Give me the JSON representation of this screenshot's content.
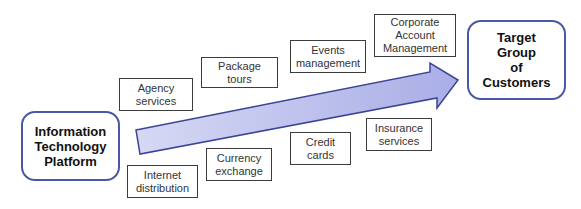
{
  "diagram": {
    "source": {
      "label": "Information\nTechnology\nPlatform"
    },
    "target": {
      "label": "Target\nGroup\nof\nCustomers"
    },
    "arrow": {
      "fill": "#b8bcec",
      "stroke": "#3b4494"
    },
    "services_above": [
      {
        "label": "Agency\nservices"
      },
      {
        "label": "Package\ntours"
      },
      {
        "label": "Events\nmanagement"
      },
      {
        "label": "Corporate\nAccount\nManagement"
      }
    ],
    "services_below": [
      {
        "label": "Internet\ndistribution"
      },
      {
        "label": "Currency\nexchange"
      },
      {
        "label": "Credit\ncards"
      },
      {
        "label": "Insurance\nservices"
      }
    ]
  }
}
